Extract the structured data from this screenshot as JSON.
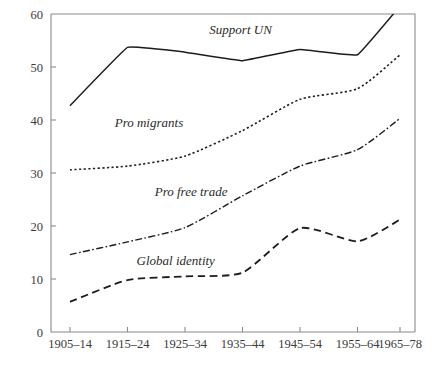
{
  "chart_data": {
    "type": "line",
    "title": "",
    "subtitle": "",
    "xlabel": "",
    "ylabel": "",
    "grid": false,
    "legend_position": "inline-labels",
    "categories": [
      "1905–14",
      "1915–24",
      "1925–34",
      "1935–44",
      "1945–54",
      "1955–64",
      "1965–78"
    ],
    "xlim": [
      0,
      6
    ],
    "ylim": [
      0,
      60
    ],
    "yticks": [
      0,
      10,
      20,
      30,
      40,
      50,
      60
    ],
    "ytick_labels": [
      "0",
      "10",
      "20",
      "30",
      "40",
      "50",
      "60"
    ],
    "series": [
      {
        "name": "Support UN",
        "line_style": "solid",
        "values": [
          42.7,
          53.7,
          52.8,
          51.2,
          53.3,
          52.3,
          61.5
        ]
      },
      {
        "name": "Pro migrants",
        "line_style": "dotted",
        "values": [
          30.6,
          31.3,
          33.2,
          38.0,
          43.9,
          45.9,
          52.3
        ]
      },
      {
        "name": "Pro free trade",
        "line_style": "dashdot",
        "values": [
          14.6,
          17.0,
          19.7,
          25.7,
          31.3,
          34.4,
          40.3
        ]
      },
      {
        "name": "Global identity",
        "line_style": "dashed",
        "values": [
          5.7,
          9.8,
          10.5,
          11.2,
          19.6,
          17.1,
          21.2
        ]
      }
    ],
    "annotations": [
      {
        "text": "Support UN",
        "x_frac": 0.435,
        "y_value": 56.2
      },
      {
        "text": "Pro migrants",
        "x_frac": 0.175,
        "y_value": 38.6
      },
      {
        "text": "Pro free trade",
        "x_frac": 0.285,
        "y_value": 25.6
      },
      {
        "text": "Global identity",
        "x_frac": 0.235,
        "y_value": 12.6
      }
    ],
    "colors": {
      "line": "#1c1c1c",
      "axis": "#8a8a8a",
      "text": "#2b2b2b",
      "background": "#ffffff"
    }
  }
}
